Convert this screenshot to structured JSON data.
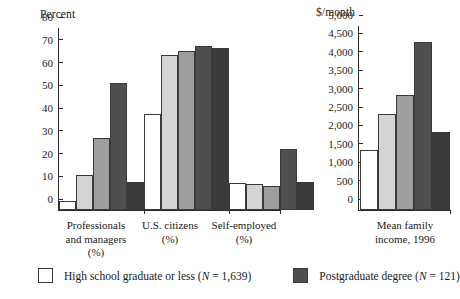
{
  "chart_data": [
    {
      "id": "percent-panel",
      "type": "bar",
      "title": "",
      "unit_label": "Percent",
      "ylabel": "Percent",
      "xlabel": "",
      "ylim": [
        0,
        80
      ],
      "yticks": [
        0,
        10,
        20,
        30,
        40,
        50,
        60,
        70,
        80
      ],
      "ytick_labels": [
        "0",
        "10",
        "20",
        "30",
        "40",
        "50",
        "60",
        "70",
        "80"
      ],
      "grid": false,
      "legend_position": "bottom",
      "categories": [
        "Professionals and managers (%)",
        "U.S. citizens (%)",
        "Self-employed (%)"
      ],
      "category_lines": [
        [
          "Professionals",
          "and managers (%)"
        ],
        [
          "U.S. citizens",
          "(%)"
        ],
        [
          "Self-employed",
          "(%)"
        ]
      ],
      "series": [
        {
          "name": "High school graduate or less",
          "color": "#ffffff",
          "values": [
            4,
            42,
            12
          ]
        },
        {
          "name": "Some college",
          "color": "#d4d4d4",
          "values": [
            15.5,
            68,
            11.5
          ]
        },
        {
          "name": "College graduate",
          "color": "#9e9e9e",
          "values": [
            31.5,
            70,
            10.5
          ]
        },
        {
          "name": "Postgraduate degree",
          "color": "#4f4f4f",
          "values": [
            56,
            72,
            27
          ]
        },
        {
          "name": "Other",
          "color": "#3b3b3b",
          "values": [
            12.5,
            71,
            12.5
          ]
        }
      ]
    },
    {
      "id": "income-panel",
      "type": "bar",
      "title": "",
      "unit_label": "$/month",
      "ylabel": "$/month",
      "xlabel": "",
      "ylim": [
        0,
        5000
      ],
      "yticks": [
        0,
        500,
        1000,
        1500,
        2000,
        2500,
        3000,
        3500,
        4000,
        4500,
        5000
      ],
      "ytick_labels": [
        "0",
        "500",
        "1,000",
        "1,500",
        "2,000",
        "2,500",
        "3,000",
        "3,500",
        "4,000",
        "4,500",
        "5,000"
      ],
      "grid": false,
      "legend_position": "bottom",
      "categories": [
        "Mean family income, 1996"
      ],
      "category_lines": [
        [
          "Mean family",
          "income, 1996"
        ]
      ],
      "series": [
        {
          "name": "High school graduate or less",
          "color": "#ffffff",
          "values": [
            1620
          ]
        },
        {
          "name": "Some college",
          "color": "#d4d4d4",
          "values": [
            2610
          ]
        },
        {
          "name": "College graduate",
          "color": "#9e9e9e",
          "values": [
            3120
          ]
        },
        {
          "name": "Postgraduate degree",
          "color": "#4f4f4f",
          "values": [
            4560
          ]
        },
        {
          "name": "Other",
          "color": "#3b3b3b",
          "values": [
            2120
          ]
        }
      ]
    }
  ],
  "legend": {
    "entries": [
      {
        "label": "High school graduate or less (N = 1,639)",
        "color": "#ffffff"
      },
      {
        "label": "Postgraduate degree (N = 121)",
        "color": "#4f4f4f"
      }
    ]
  },
  "axis_units": {
    "left": "Percent",
    "right": "$/month"
  }
}
